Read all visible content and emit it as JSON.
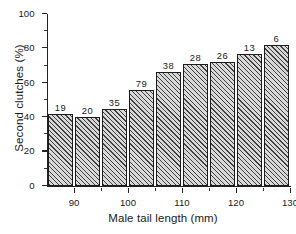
{
  "chart_data": {
    "type": "bar",
    "title": "",
    "xlabel": "Male tail length (mm)",
    "ylabel": "Second clutches (%)",
    "xlim": [
      85,
      130
    ],
    "ylim": [
      0,
      100
    ],
    "grid": false,
    "legend": null,
    "x_tick_labels": [
      "90",
      "100",
      "110",
      "120",
      "130"
    ],
    "x_tick_values": [
      90,
      100,
      110,
      120,
      130
    ],
    "x_minor_tick_values": [
      95,
      105,
      115,
      125
    ],
    "y_tick_labels": [
      "0",
      "20",
      "40",
      "60",
      "80",
      "100"
    ],
    "y_tick_values": [
      0,
      20,
      40,
      60,
      80,
      100
    ],
    "y_minor_tick_values": [
      10,
      30,
      50,
      70,
      90
    ],
    "bin_width": 5,
    "categories": [
      "85-90",
      "90-95",
      "95-100",
      "100-105",
      "105-110",
      "110-115",
      "115-120",
      "120-125",
      "125-130"
    ],
    "bin_centers": [
      87.5,
      92.5,
      97.5,
      102.5,
      107.5,
      112.5,
      117.5,
      122.5,
      127.5
    ],
    "bin_starts": [
      85,
      90,
      95,
      100,
      105,
      110,
      115,
      120,
      125
    ],
    "values": [
      42,
      40,
      45,
      56,
      66,
      71,
      72,
      77,
      82
    ],
    "annotations": [
      "19",
      "20",
      "35",
      "79",
      "38",
      "28",
      "26",
      "13",
      "6"
    ],
    "annotation_meaning": "sample size above each bar",
    "bar_fill": "#d8d8d8",
    "bar_hatch": "diagonal-45",
    "bar_edge_color": "#1c1c1c",
    "axis_color": "#222222",
    "background": "#ffffff"
  }
}
